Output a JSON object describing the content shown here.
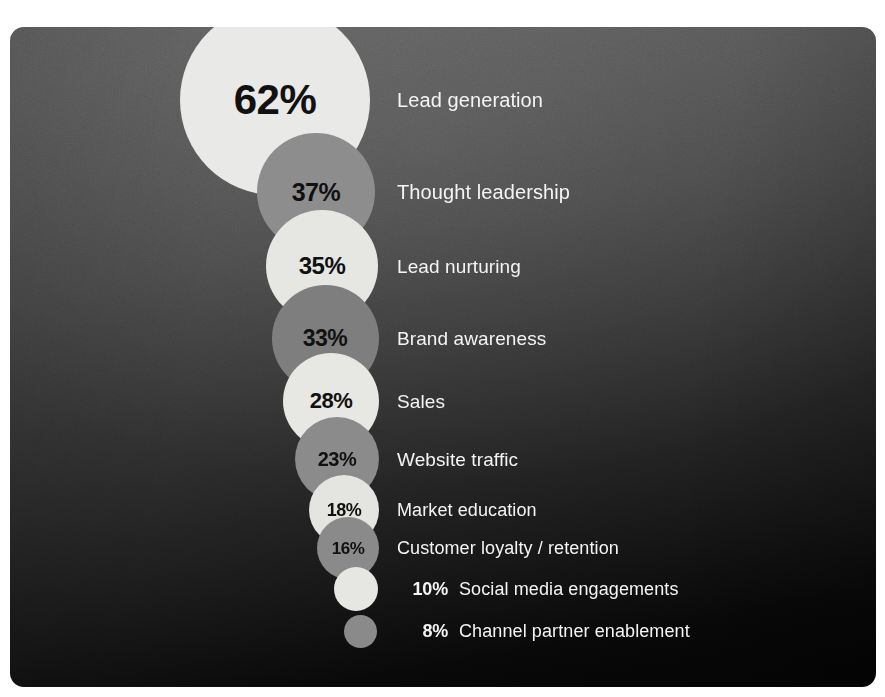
{
  "chart_data": {
    "type": "bar",
    "title": "",
    "subtitle": "",
    "xlabel": "",
    "ylabel": "",
    "categories": [
      "Lead generation",
      "Thought leadership",
      "Lead nurturing",
      "Brand awareness",
      "Sales",
      "Website traffic",
      "Market education",
      "Customer loyalty / retention",
      "Social media engagements",
      "Channel partner enablement"
    ],
    "values": [
      62,
      37,
      35,
      33,
      28,
      23,
      18,
      16,
      10,
      8
    ],
    "value_labels": [
      "62%",
      "37%",
      "35%",
      "33%",
      "28%",
      "23%",
      "18%",
      "16%",
      "10%",
      "8%"
    ],
    "unit": "%",
    "ylim": [
      0,
      62
    ],
    "grid": false,
    "legend": null,
    "rendering": "proportional bubbles, area-scaled, vertically stacked and left-aligned at their right edge"
  },
  "panel": {
    "background_top_color": "#5e5e5e",
    "background_bottom_color": "#020202",
    "corner_radius_px": 14
  },
  "style": {
    "label_color": "#f4f4f4",
    "inner_value_color": "#111111",
    "outer_value_color": "#f2f2f2",
    "bubble_light_color": "#e8e8e6",
    "bubble_mid_color": "#9a9a9a",
    "bubble_dark_color": "#6e6e6e"
  },
  "rows": [
    {
      "value_label": "62%",
      "label": "Lead generation",
      "bubble": {
        "cx": 275,
        "cy": 100,
        "d": 190,
        "color": "#e9e9e7",
        "value_inside": true,
        "value_font_px": 42
      },
      "label_x": 397,
      "label_font_px": 20
    },
    {
      "value_label": "37%",
      "label": "Thought leadership",
      "bubble": {
        "cx": 316,
        "cy": 192,
        "d": 118,
        "color": "#8d8d8d",
        "value_inside": true,
        "value_font_px": 25
      },
      "label_x": 397,
      "label_font_px": 20
    },
    {
      "value_label": "35%",
      "label": "Lead nurturing",
      "bubble": {
        "cx": 322,
        "cy": 266,
        "d": 112,
        "color": "#e6e6e3",
        "value_inside": true,
        "value_font_px": 24
      },
      "label_x": 397,
      "label_font_px": 19
    },
    {
      "value_label": "33%",
      "label": "Brand awareness",
      "bubble": {
        "cx": 325,
        "cy": 338,
        "d": 107,
        "color": "#7e7e7e",
        "value_inside": true,
        "value_font_px": 23
      },
      "label_x": 397,
      "label_font_px": 19
    },
    {
      "value_label": "28%",
      "label": "Sales",
      "bubble": {
        "cx": 331,
        "cy": 401,
        "d": 96,
        "color": "#e7e7e4",
        "value_inside": true,
        "value_font_px": 22
      },
      "label_x": 397,
      "label_font_px": 19
    },
    {
      "value_label": "23%",
      "label": "Website traffic",
      "bubble": {
        "cx": 337,
        "cy": 459,
        "d": 84,
        "color": "#8b8b8b",
        "value_inside": true,
        "value_font_px": 20
      },
      "label_x": 397,
      "label_font_px": 19
    },
    {
      "value_label": "18%",
      "label": "Market education",
      "bubble": {
        "cx": 344,
        "cy": 510,
        "d": 70,
        "color": "#e4e4e1",
        "value_inside": true,
        "value_font_px": 18
      },
      "label_x": 397,
      "label_font_px": 18
    },
    {
      "value_label": "16%",
      "label": "Customer loyalty / retention",
      "bubble": {
        "cx": 348,
        "cy": 548,
        "d": 62,
        "color": "#8a8a8a",
        "value_inside": true,
        "value_font_px": 17
      },
      "label_x": 397,
      "label_font_px": 18
    },
    {
      "value_label": "10%",
      "label": "Social media engagements",
      "bubble": {
        "cx": 356,
        "cy": 589,
        "d": 44,
        "color": "#e6e6e3",
        "value_inside": false,
        "value_font_px": 18
      },
      "value_right_x": 448,
      "label_x": 459,
      "label_font_px": 18
    },
    {
      "value_label": "8%",
      "label": "Channel partner enablement",
      "bubble": {
        "cx": 360,
        "cy": 631,
        "d": 33,
        "color": "#8a8a8a",
        "value_inside": false,
        "value_font_px": 18
      },
      "value_right_x": 448,
      "label_x": 459,
      "label_font_px": 18
    }
  ]
}
